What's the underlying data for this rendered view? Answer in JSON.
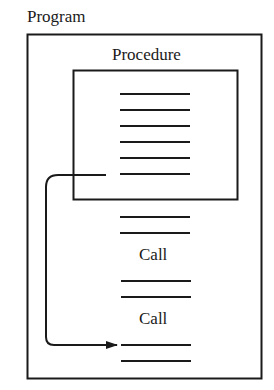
{
  "diagram": {
    "program_label": "Program",
    "procedure_label": "Procedure",
    "call_labels": [
      "Call",
      "Call"
    ],
    "procedure_lines": 6,
    "colors": {
      "stroke": "#1a1a1a",
      "background": "#ffffff"
    }
  }
}
